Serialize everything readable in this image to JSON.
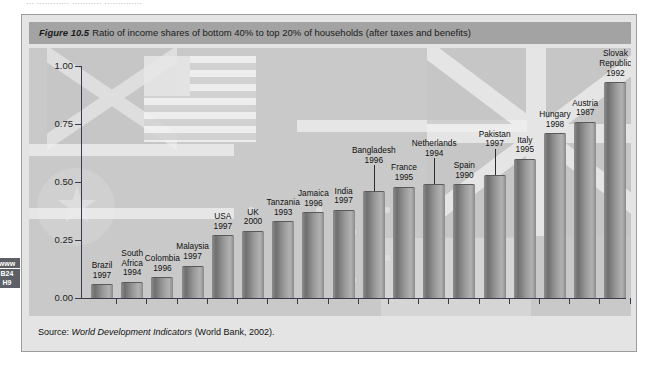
{
  "page_head": "...  ............  ...........  ..............",
  "margin_tab": {
    "line1": "www",
    "line2": "B24",
    "line3": "H9"
  },
  "figure": {
    "number": "Figure 10.5",
    "caption": "Ratio of income shares of bottom 40% to top 20% of households (after taxes and benefits)",
    "source_prefix": "Source:",
    "source_italic": "World Development Indicators",
    "source_suffix": "(World Bank, 2002)."
  },
  "chart_data": {
    "type": "bar",
    "title": "Ratio of income shares of bottom 40% to top 20% of households (after taxes and benefits)",
    "xlabel": "",
    "ylabel": "",
    "ylim": [
      0.0,
      1.0
    ],
    "ytick_labels": [
      "0.00",
      "0.25",
      "0.50",
      "0.75",
      "1.00"
    ],
    "ytick_values": [
      0.0,
      0.25,
      0.5,
      0.75,
      1.0
    ],
    "grid": false,
    "legend": "none",
    "categories": [
      "Brazil",
      "South Africa",
      "Colombia",
      "Malaysia",
      "USA",
      "UK",
      "Tanzania",
      "Jamaica",
      "India",
      "Bangladesh",
      "France",
      "Netherlands",
      "Spain",
      "Pakistan",
      "Italy",
      "Hungary",
      "Austria",
      "Slovak Republic"
    ],
    "years": [
      "1997",
      "1994",
      "1996",
      "1997",
      "1997",
      "2000",
      "1993",
      "1996",
      "1997",
      "1996",
      "1995",
      "1994",
      "1990",
      "1997",
      "1995",
      "1998",
      "1987",
      "1992"
    ],
    "values": [
      0.06,
      0.07,
      0.09,
      0.14,
      0.27,
      0.29,
      0.33,
      0.37,
      0.38,
      0.46,
      0.48,
      0.49,
      0.49,
      0.53,
      0.6,
      0.71,
      0.76,
      0.93
    ],
    "label_above_bar": [
      true,
      true,
      true,
      true,
      true,
      true,
      true,
      true,
      true,
      true,
      true,
      true,
      true,
      true,
      true,
      true,
      true,
      true
    ],
    "source": "Source: World Development Indicators (World Bank, 2002)."
  },
  "colors": {
    "figure_background": "#e4e4e4",
    "plot_background": "#c9c9c9",
    "caption_bar": "#a3a3a3",
    "bar_fill": "#8d8d8d",
    "axis": "#3a3a4a",
    "text": "#121212",
    "margin_tab": "#5d6066"
  }
}
